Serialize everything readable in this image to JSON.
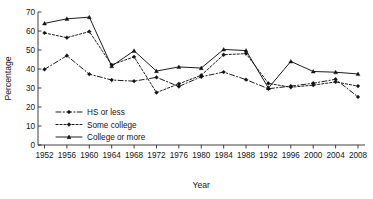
{
  "chart_data": {
    "type": "line",
    "title": "",
    "xlabel": "Year",
    "ylabel": "Percentage",
    "xlim": [
      1952,
      2008
    ],
    "ylim": [
      0,
      70
    ],
    "grid": false,
    "legend_position": "lower-left-inside",
    "x": [
      1952,
      1956,
      1960,
      1964,
      1968,
      1972,
      1976,
      1980,
      1984,
      1988,
      1992,
      1996,
      2000,
      2004,
      2008
    ],
    "xtick_labels": [
      "1952",
      "1956",
      "1960",
      "1964",
      "1968",
      "1972",
      "1976",
      "1980",
      "1984",
      "1988",
      "1992",
      "1996",
      "2000",
      "2004",
      "2008"
    ],
    "ytick_labels": [
      "0",
      "10",
      "20",
      "30",
      "40",
      "50",
      "60",
      "70"
    ],
    "ytick_values": [
      0,
      10,
      20,
      30,
      40,
      50,
      60,
      70
    ],
    "series": [
      {
        "name": "HS or less",
        "style": "dash-dot",
        "marker": "diamond",
        "values": [
          39.8,
          47.0,
          37.3,
          34.2,
          33.6,
          35.6,
          30.8,
          35.9,
          38.4,
          34.4,
          29.6,
          31.0,
          32.5,
          34.6,
          25.3
        ]
      },
      {
        "name": "Some college",
        "style": "dashed",
        "marker": "diamond",
        "values": [
          59.0,
          56.5,
          59.7,
          42.2,
          46.4,
          27.6,
          32.2,
          36.7,
          47.5,
          48.1,
          32.4,
          30.4,
          31.5,
          33.2,
          31.0
        ]
      },
      {
        "name": "College or more",
        "style": "solid",
        "marker": "triangle",
        "values": [
          64.0,
          66.4,
          67.3,
          41.5,
          49.6,
          38.9,
          41.1,
          40.5,
          50.3,
          49.7,
          30.0,
          44.0,
          38.7,
          38.3,
          37.4
        ]
      }
    ],
    "legend_entries": [
      {
        "label": "HS or less",
        "style": "dash-dot",
        "marker": "diamond"
      },
      {
        "label": "Some college",
        "style": "dashed",
        "marker": "diamond"
      },
      {
        "label": "College or more",
        "style": "solid",
        "marker": "triangle"
      }
    ]
  }
}
